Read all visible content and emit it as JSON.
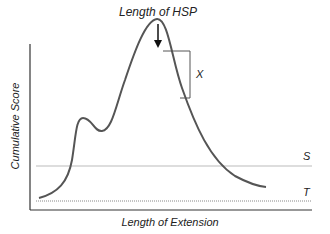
{
  "diagram": {
    "title_annotation": "Length of HSP",
    "bracket_label": "X",
    "y_axis_label": "Cumulative Score",
    "x_axis_label": "Length of Extension",
    "threshold_lines": [
      {
        "label": "S",
        "style": "solid light gray"
      },
      {
        "label": "T",
        "style": "dotted"
      }
    ],
    "colors": {
      "curve": "#555555",
      "axis": "#333333",
      "line_s": "#bbbbbb",
      "line_t": "#888888"
    }
  }
}
